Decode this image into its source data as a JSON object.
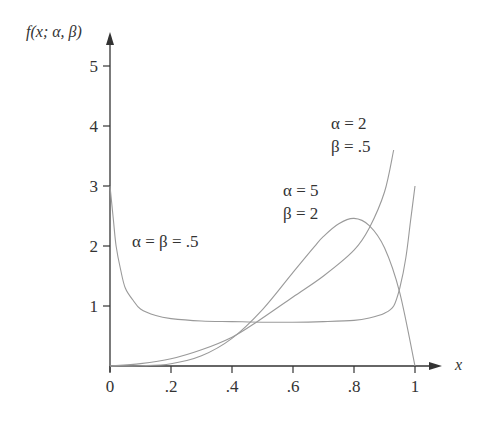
{
  "chart_data": {
    "type": "line",
    "title": "",
    "xlabel": "x",
    "ylabel": "f(x; α, β)",
    "xlim": [
      0,
      1
    ],
    "ylim": [
      0,
      5
    ],
    "grid": false,
    "legend": "none (inline annotations)",
    "x_ticks": [
      "0",
      ".2",
      ".4",
      ".6",
      ".8",
      "1"
    ],
    "y_ticks": [
      "1",
      "2",
      "3",
      "4",
      "5"
    ],
    "series": [
      {
        "name": "α = β = .5",
        "annotation": [
          "α = β = .5"
        ],
        "x": [
          0.0,
          0.01,
          0.02,
          0.035,
          0.05,
          0.075,
          0.1,
          0.15,
          0.2,
          0.3,
          0.4,
          0.5,
          0.6,
          0.7,
          0.8,
          0.85,
          0.9,
          0.93,
          0.95,
          0.97,
          0.985,
          1.0
        ],
        "y": [
          3.0,
          2.5,
          2.0,
          1.6,
          1.3,
          1.1,
          0.95,
          0.84,
          0.79,
          0.75,
          0.74,
          0.73,
          0.73,
          0.74,
          0.76,
          0.8,
          0.88,
          1.0,
          1.3,
          1.8,
          2.4,
          3.0
        ]
      },
      {
        "name": "α = 5, β = 2",
        "annotation": [
          "α = 5",
          "β = 2"
        ],
        "x": [
          0.0,
          0.1,
          0.2,
          0.3,
          0.4,
          0.5,
          0.6,
          0.67,
          0.7,
          0.75,
          0.8,
          0.85,
          0.9,
          0.95,
          1.0
        ],
        "y": [
          0.0,
          0.003,
          0.038,
          0.17,
          0.46,
          0.94,
          1.56,
          1.99,
          2.16,
          2.37,
          2.46,
          2.34,
          1.97,
          1.22,
          0.0
        ]
      },
      {
        "name": "α = 2, β = .5",
        "annotation": [
          "α = 2",
          "β = .5"
        ],
        "x": [
          0.0,
          0.1,
          0.2,
          0.3,
          0.4,
          0.48,
          0.6,
          0.7,
          0.8,
          0.85,
          0.9,
          0.93
        ],
        "y": [
          0.0,
          0.04,
          0.12,
          0.27,
          0.48,
          0.73,
          1.15,
          1.5,
          1.93,
          2.3,
          2.9,
          3.6
        ]
      }
    ]
  },
  "labels": {
    "ylabel": "f(x; α, β)",
    "xlabel": "x",
    "ann_u_line1": "α = β = .5",
    "ann_52_line1": "α = 5",
    "ann_52_line2": "β = 2",
    "ann_205_line1": "α = 2",
    "ann_205_line2": "β = .5"
  },
  "colors": {
    "axis": "#333333",
    "curve": "#9a9a9a",
    "text": "#333333"
  }
}
